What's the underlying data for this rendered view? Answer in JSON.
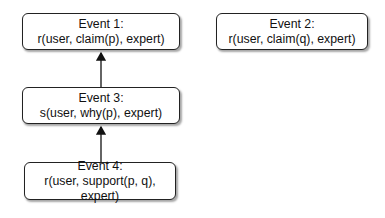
{
  "nodes": [
    {
      "id": "event1",
      "title": "Event 1:",
      "label": "r(user, claim(p), expert)"
    },
    {
      "id": "event2",
      "title": "Event 2:",
      "label": "r(user, claim(q), expert)"
    },
    {
      "id": "event3",
      "title": "Event 3:",
      "label": "s(user, why(p), expert)"
    },
    {
      "id": "event4",
      "title": "Event 4:",
      "label": "r(user, support(p, q), expert)"
    }
  ],
  "edges": [
    {
      "from": "event3",
      "to": "event1"
    },
    {
      "from": "event4",
      "to": "event3"
    }
  ]
}
